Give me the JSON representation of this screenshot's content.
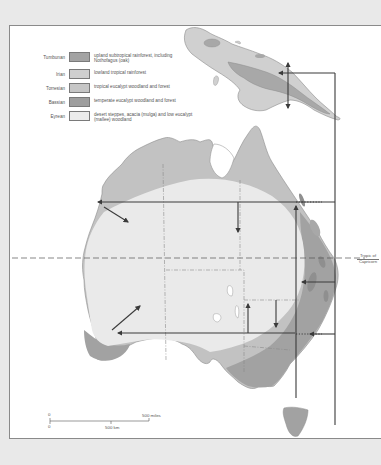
{
  "legend": {
    "items": [
      {
        "name": "Tumbunan",
        "description": "upland subtropical rainforest, including Nothofagus (oak)",
        "color": "#a3a3a3"
      },
      {
        "name": "Irian",
        "description": "lowland tropical rainforest",
        "color": "#cfcfcf"
      },
      {
        "name": "Torresian",
        "description": "tropical eucalypt woodland and forest",
        "color": "#c6c6c6"
      },
      {
        "name": "Bassian",
        "description": "temperate eucalypt woodland and forest",
        "color": "#9e9e9e"
      },
      {
        "name": "Eyrean",
        "description": "desert steppes, acacia (mulga) and low eucalypt (mallee) woodland",
        "color": "#ececec"
      }
    ]
  },
  "map": {
    "tropic_label_line1": "Tropic of",
    "tropic_label_line2": "Capricorn",
    "colors": {
      "torresian": "#c2c2c2",
      "eyrean": "#eaeaea",
      "bassian": "#a2a2a2",
      "tumbunan": "#a8a8a8",
      "irian": "#d0d0d0",
      "arrow": "#3a3a3a",
      "frame_bg": "#e9e9e9"
    }
  },
  "scale_bar": {
    "zero_top": "0",
    "zero_bottom": "0",
    "miles_label": "500 miles",
    "km_label": "500  km"
  }
}
